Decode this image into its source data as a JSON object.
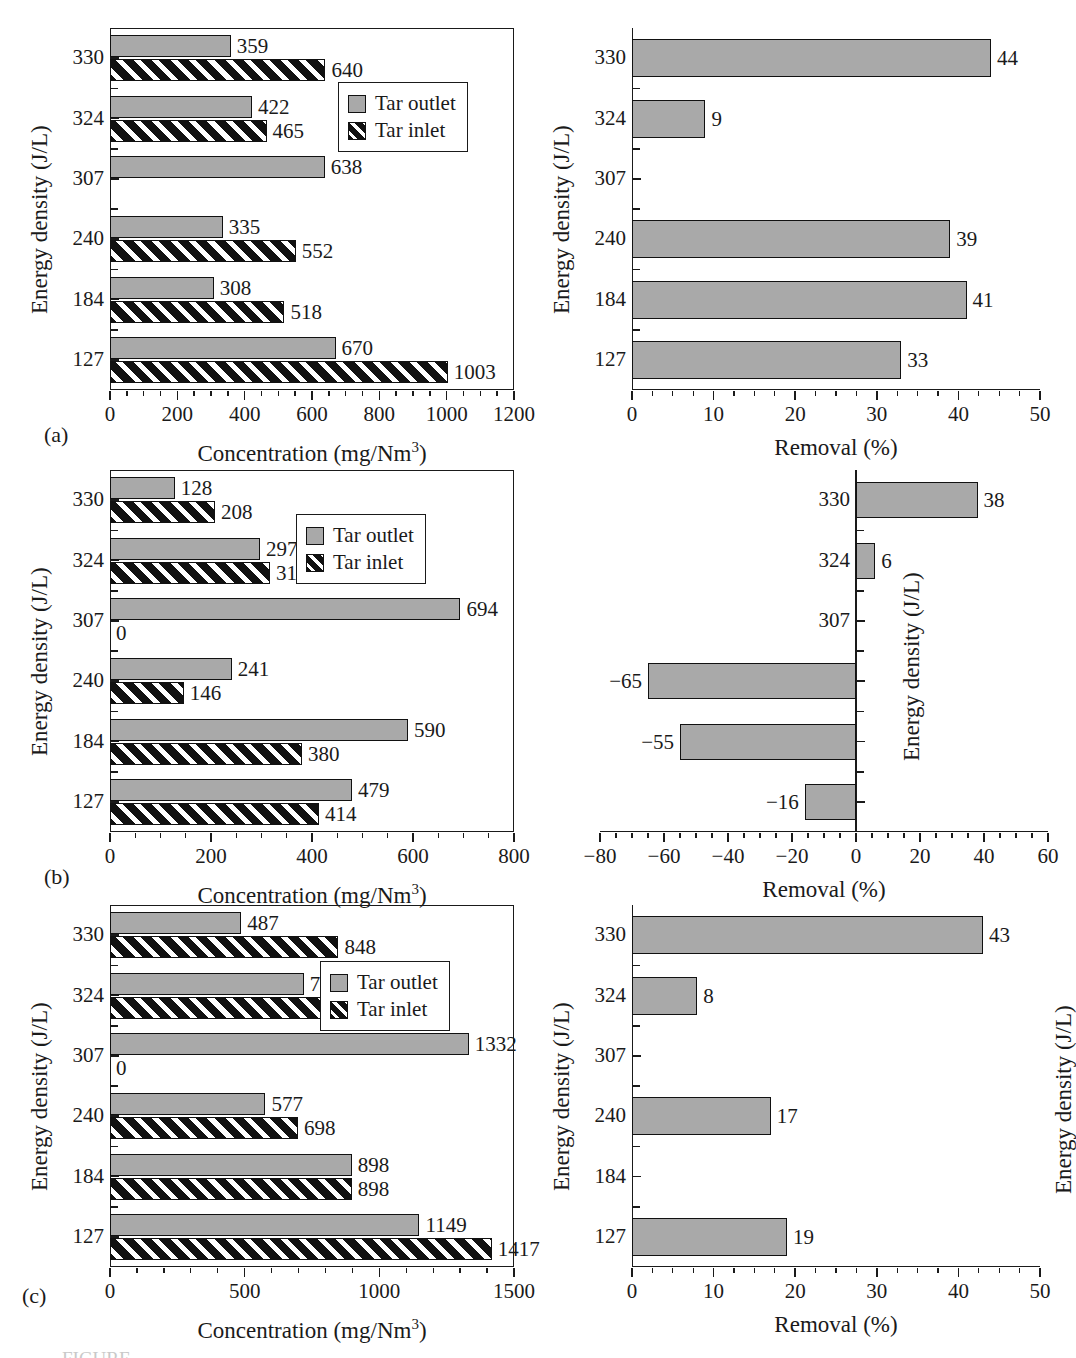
{
  "figure": {
    "panels": [
      "(a)",
      "(b)",
      "(c)"
    ],
    "caption_partial": "FIGURE"
  },
  "legend": {
    "outlet": "Tar outlet",
    "inlet": "Tar inlet"
  },
  "axis_titles": {
    "concentration": "Concentration (mg/Nm",
    "concentration_sup": "3",
    "concentration_close": ")",
    "removal": "Removal (%)",
    "energy_density": "Energy density (J/L)"
  },
  "categories": [
    "330",
    "324",
    "307",
    "240",
    "184",
    "127"
  ],
  "chart_data": [
    {
      "id": "a-left",
      "panel": "(a)",
      "type": "bar",
      "orientation": "horizontal",
      "grouped": true,
      "title": "",
      "xlabel": "Concentration (mg/Nm3)",
      "ylabel": "Energy density (J/L)",
      "categories": [
        "330",
        "324",
        "307",
        "240",
        "184",
        "127"
      ],
      "xlim": [
        0,
        1200
      ],
      "xticks": [
        0,
        200,
        400,
        600,
        800,
        1000,
        1200
      ],
      "xticklabels": [
        "0",
        "200",
        "400",
        "600",
        "800",
        "1000",
        "1200"
      ],
      "minor_tick_interval": 50,
      "grid": false,
      "frame": "full-box",
      "series": [
        {
          "name": "Tar outlet",
          "values": [
            359,
            422,
            638,
            335,
            308,
            670
          ],
          "labels": [
            "359",
            "422",
            "638",
            "335",
            "308",
            "670"
          ]
        },
        {
          "name": "Tar inlet",
          "values": [
            640,
            465,
            null,
            552,
            518,
            1003
          ],
          "labels": [
            "640",
            "465",
            "",
            "552",
            "518",
            "1003"
          ]
        }
      ]
    },
    {
      "id": "a-right",
      "panel": "(a)",
      "type": "bar",
      "orientation": "horizontal",
      "grouped": false,
      "title": "",
      "xlabel": "Removal (%)",
      "ylabel": "Energy density (J/L)",
      "categories": [
        "330",
        "324",
        "307",
        "240",
        "184",
        "127"
      ],
      "xlim": [
        0,
        50
      ],
      "xticks": [
        0,
        10,
        20,
        30,
        40,
        50
      ],
      "xticklabels": [
        "0",
        "10",
        "20",
        "30",
        "40",
        "50"
      ],
      "minor_tick_interval": 2.5,
      "grid": false,
      "frame": "l-shape",
      "series": [
        {
          "name": "Removal",
          "values": [
            44,
            9,
            null,
            39,
            41,
            33
          ],
          "labels": [
            "44",
            "9",
            "",
            "39",
            "41",
            "33"
          ]
        }
      ]
    },
    {
      "id": "b-left",
      "panel": "(b)",
      "type": "bar",
      "orientation": "horizontal",
      "grouped": true,
      "title": "",
      "xlabel": "Concentration (mg/Nm3)",
      "ylabel": "Energy density (J/L)",
      "categories": [
        "330",
        "324",
        "307",
        "240",
        "184",
        "127"
      ],
      "xlim": [
        0,
        800
      ],
      "xticks": [
        0,
        200,
        400,
        600,
        800
      ],
      "xticklabels": [
        "0",
        "200",
        "400",
        "600",
        "800"
      ],
      "minor_tick_interval": 50,
      "grid": false,
      "frame": "full-box",
      "series": [
        {
          "name": "Tar outlet",
          "values": [
            128,
            297,
            694,
            241,
            590,
            479
          ],
          "labels": [
            "128",
            "297",
            "694",
            "241",
            "590",
            "479"
          ]
        },
        {
          "name": "Tar inlet",
          "values": [
            208,
            317,
            0,
            146,
            380,
            414
          ],
          "labels": [
            "208",
            "317",
            "0",
            "146",
            "380",
            "414"
          ]
        }
      ]
    },
    {
      "id": "b-right",
      "panel": "(b)",
      "type": "bar",
      "orientation": "horizontal",
      "grouped": false,
      "title": "",
      "xlabel": "Removal (%)",
      "ylabel": "Energy density (J/L)",
      "categories": [
        "330",
        "324",
        "307",
        "240",
        "184",
        "127"
      ],
      "xlim": [
        -80,
        60
      ],
      "xticks": [
        -80,
        -60,
        -40,
        -20,
        0,
        20,
        40,
        60
      ],
      "xticklabels": [
        "−80",
        "−60",
        "−40",
        "−20",
        "0",
        "20",
        "40",
        "60"
      ],
      "minor_tick_interval": 5,
      "grid": false,
      "frame": "bottom-axis-plus-zero-spine",
      "series": [
        {
          "name": "Removal",
          "values": [
            38,
            6,
            null,
            -65,
            -55,
            -16
          ],
          "labels": [
            "38",
            "6",
            "",
            "−65",
            "−55",
            "−16"
          ]
        }
      ]
    },
    {
      "id": "c-left",
      "panel": "(c)",
      "type": "bar",
      "orientation": "horizontal",
      "grouped": true,
      "title": "",
      "xlabel": "Concentration (mg/Nm3)",
      "ylabel": "Energy density (J/L)",
      "categories": [
        "330",
        "324",
        "307",
        "240",
        "184",
        "127"
      ],
      "xlim": [
        0,
        1500
      ],
      "xticks": [
        0,
        500,
        1000,
        1500
      ],
      "xticklabels": [
        "0",
        "500",
        "1000",
        "1500"
      ],
      "minor_tick_interval": 100,
      "grid": false,
      "frame": "full-box",
      "series": [
        {
          "name": "Tar outlet",
          "values": [
            487,
            719,
            1332,
            577,
            898,
            1149
          ],
          "labels": [
            "487",
            "719",
            "1332",
            "577",
            "898",
            "1149"
          ]
        },
        {
          "name": "Tar inlet",
          "values": [
            848,
            782,
            0,
            698,
            898,
            1417
          ],
          "labels": [
            "848",
            "782",
            "0",
            "698",
            "898",
            "1417"
          ]
        }
      ]
    },
    {
      "id": "c-right",
      "panel": "(c)",
      "type": "bar",
      "orientation": "horizontal",
      "grouped": false,
      "title": "",
      "xlabel": "Removal (%)",
      "ylabel": "Energy density (J/L)",
      "categories": [
        "330",
        "324",
        "307",
        "240",
        "184",
        "127"
      ],
      "xlim": [
        0,
        50
      ],
      "xticks": [
        0,
        10,
        20,
        30,
        40,
        50
      ],
      "xticklabels": [
        "0",
        "10",
        "20",
        "30",
        "40",
        "50"
      ],
      "minor_tick_interval": 2.5,
      "grid": false,
      "frame": "l-shape",
      "series": [
        {
          "name": "Removal",
          "values": [
            43,
            8,
            null,
            17,
            null,
            19
          ],
          "labels": [
            "43",
            "8",
            "",
            "17",
            "",
            "19"
          ]
        }
      ]
    }
  ],
  "colors": {
    "outlet_fill": "#a9a9a9",
    "inlet_fill": "#111111",
    "inlet_hatch": "#ffffff",
    "axis": "#1a1a1a",
    "text": "#1a1a1a",
    "background": "#ffffff"
  }
}
